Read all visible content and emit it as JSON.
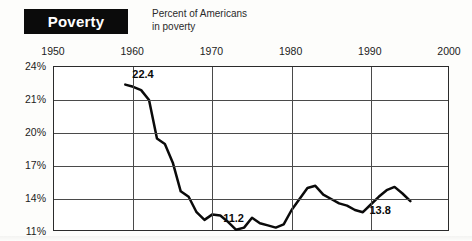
{
  "header": {
    "title": "Poverty",
    "subtitle_line1": "Percent of Americans",
    "subtitle_line2": "in poverty"
  },
  "callouts": [
    {
      "name": "peak-1959",
      "text": "22.4"
    },
    {
      "name": "low-1973",
      "text": "11.2"
    },
    {
      "name": "end-1995",
      "text": "13.8"
    }
  ],
  "chart_data": {
    "type": "line",
    "title": "Poverty",
    "subtitle": "Percent of Americans in poverty",
    "xlabel": "",
    "ylabel": "",
    "xlim": [
      1950,
      2000
    ],
    "ylim": [
      11,
      24
    ],
    "xticks": [
      1950,
      1960,
      1970,
      1980,
      1990,
      2000
    ],
    "xticklabels": [
      "1950",
      "1960",
      "1970",
      "1980",
      "1990",
      "2000"
    ],
    "yticks": [
      24,
      21,
      20,
      17,
      14,
      11
    ],
    "yticklabels": [
      "24%",
      "21%",
      "20%",
      "17%",
      "14%",
      "11%"
    ],
    "grid": true,
    "legend": false,
    "xtick_position": "top",
    "series": [
      {
        "name": "Percent of Americans in poverty",
        "color": "#0a0a0a",
        "x": [
          1959,
          1960,
          1961,
          1962,
          1963,
          1964,
          1965,
          1966,
          1967,
          1968,
          1969,
          1970,
          1971,
          1972,
          1973,
          1974,
          1975,
          1976,
          1977,
          1978,
          1979,
          1980,
          1981,
          1982,
          1983,
          1984,
          1985,
          1986,
          1987,
          1988,
          1989,
          1990,
          1991,
          1992,
          1993,
          1994,
          1995
        ],
        "values": [
          22.4,
          22.2,
          21.9,
          21.0,
          19.5,
          19.0,
          17.3,
          14.7,
          14.2,
          12.8,
          12.1,
          12.6,
          12.5,
          11.9,
          11.2,
          11.4,
          12.3,
          11.8,
          11.6,
          11.4,
          11.7,
          13.0,
          14.0,
          15.0,
          15.2,
          14.4,
          14.0,
          13.6,
          13.4,
          13.0,
          12.8,
          13.5,
          14.2,
          14.8,
          15.1,
          14.5,
          13.8
        ]
      }
    ],
    "annotations": [
      {
        "label": "22.4",
        "x": 1959,
        "y": 22.4
      },
      {
        "label": "11.2",
        "x": 1973,
        "y": 11.2
      },
      {
        "label": "13.8",
        "x": 1995,
        "y": 13.8
      }
    ]
  }
}
